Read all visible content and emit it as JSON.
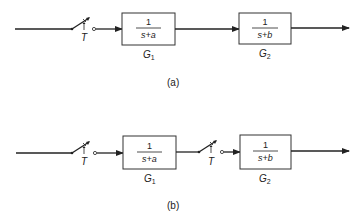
{
  "diagrams": [
    {
      "id": "a",
      "caption": "(a)",
      "sampler1_label": "T",
      "block1": {
        "name": "G",
        "sub": "1",
        "num": "1",
        "den": "s+a"
      },
      "block2": {
        "name": "G",
        "sub": "2",
        "num": "1",
        "den": "s+b"
      }
    },
    {
      "id": "b",
      "caption": "(b)",
      "sampler1_label": "T",
      "sampler2_label": "T",
      "block1": {
        "name": "G",
        "sub": "1",
        "num": "1",
        "den": "s+a"
      },
      "block2": {
        "name": "G",
        "sub": "2",
        "num": "1",
        "den": "s+b"
      }
    }
  ]
}
